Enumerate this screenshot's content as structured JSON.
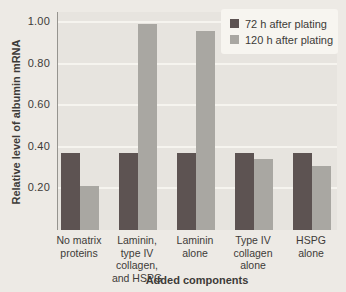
{
  "colors": {
    "outer_bg": "#edeae5",
    "plot_bg": "#e7e4df",
    "gridline": "#f6f4ef",
    "axis_line": "#96948f",
    "text": "#3d3b38",
    "legend_bg": "#f7f5f0",
    "series1": "#5d5352",
    "series2": "#a9a7a2"
  },
  "chart_data": {
    "type": "bar",
    "title": "",
    "xlabel": "Added components",
    "ylabel": "Relative level of albumin mRNA",
    "ylim": [
      0,
      1.05
    ],
    "grid": true,
    "legend_position": "top-right",
    "yticks": [
      {
        "value": 0.2,
        "label": "0.20"
      },
      {
        "value": 0.4,
        "label": "0.40"
      },
      {
        "value": 0.6,
        "label": "0.60"
      },
      {
        "value": 0.8,
        "label": "0.80"
      },
      {
        "value": 1.0,
        "label": "1.00"
      }
    ],
    "categories": [
      "No matrix proteins",
      "Laminin, type IV collagen, and HSPG",
      "Laminin alone",
      "Type IV collagen alone",
      "HSPG alone"
    ],
    "category_label_lines": [
      [
        "No matrix",
        "proteins"
      ],
      [
        "Laminin,",
        "type IV",
        "collagen,",
        "and HSPG"
      ],
      [
        "Laminin",
        "alone"
      ],
      [
        "Type IV",
        "collagen",
        "alone"
      ],
      [
        "HSPG",
        "alone"
      ]
    ],
    "series": [
      {
        "name": "72 h after plating",
        "color": "#5d5352",
        "values": [
          0.37,
          0.37,
          0.37,
          0.37,
          0.37
        ]
      },
      {
        "name": "120 h after plating",
        "color": "#a9a7a2",
        "values": [
          0.21,
          0.99,
          0.96,
          0.34,
          0.31
        ]
      }
    ]
  }
}
